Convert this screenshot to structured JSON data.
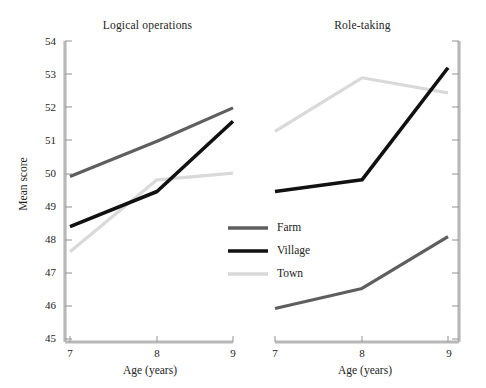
{
  "figure": {
    "ylabel": "Mean score",
    "xlabel": "Age (years)",
    "panels": [
      {
        "key": "logical",
        "title": "Logical operations"
      },
      {
        "key": "role",
        "title": "Role-taking"
      }
    ]
  },
  "axes": {
    "y_ticks": [
      "54",
      "53",
      "52",
      "51",
      "50",
      "49",
      "48",
      "47",
      "46",
      "45"
    ],
    "x_ticks": [
      "7",
      "8",
      "9"
    ]
  },
  "legend": {
    "items": [
      {
        "label": "Farm",
        "color": "#5e5e5e"
      },
      {
        "label": "Village",
        "color": "#111111"
      },
      {
        "label": "Town",
        "color": "#d9d9d9"
      }
    ]
  },
  "colors": {
    "farm": "#5e5e5e",
    "village": "#111111",
    "town": "#d9d9d9",
    "axis": "#b8b8b8",
    "text": "#232323"
  },
  "chart_data": {
    "type": "line",
    "title": "",
    "xlabel": "Age (years)",
    "ylabel": "Mean score",
    "x": [
      7,
      8,
      9
    ],
    "xlim": [
      7,
      9
    ],
    "ylim": [
      45,
      54
    ],
    "grid": false,
    "legend_position": "center",
    "panels": [
      {
        "title": "Logical operations",
        "series": [
          {
            "name": "Farm",
            "values": [
              49.95,
              51.0,
              52.0
            ]
          },
          {
            "name": "Village",
            "values": [
              48.45,
              49.5,
              51.6
            ]
          },
          {
            "name": "Town",
            "values": [
              47.7,
              49.85,
              50.05
            ]
          }
        ]
      },
      {
        "title": "Role-taking",
        "series": [
          {
            "name": "Farm",
            "values": [
              46.0,
              46.6,
              48.15
            ]
          },
          {
            "name": "Village",
            "values": [
              49.5,
              49.85,
              53.2
            ]
          },
          {
            "name": "Town",
            "values": [
              51.3,
              52.9,
              52.45
            ]
          }
        ]
      }
    ]
  }
}
